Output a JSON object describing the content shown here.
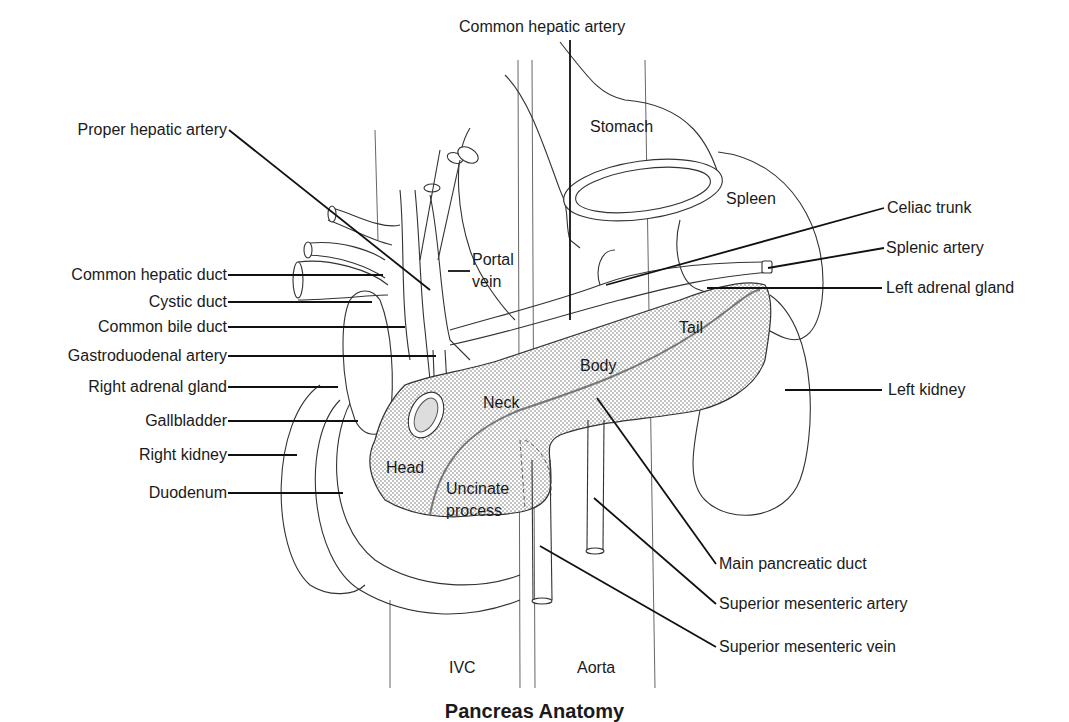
{
  "figure": {
    "title": "Pancreas anatomy",
    "caption_partial": "Pancreas Anatomy"
  },
  "labels_left": [
    {
      "id": "proper-hepatic-artery",
      "text": "Proper hepatic artery"
    },
    {
      "id": "common-hepatic-duct",
      "text": "Common hepatic duct"
    },
    {
      "id": "cystic-duct",
      "text": "Cystic duct"
    },
    {
      "id": "common-bile-duct",
      "text": "Common bile duct"
    },
    {
      "id": "gastroduodenal-artery",
      "text": "Gastroduodenal artery"
    },
    {
      "id": "right-adrenal-gland",
      "text": "Right adrenal gland"
    },
    {
      "id": "gallbladder",
      "text": "Gallbladder"
    },
    {
      "id": "right-kidney",
      "text": "Right kidney"
    },
    {
      "id": "duodenum",
      "text": "Duodenum"
    }
  ],
  "labels_right": [
    {
      "id": "celiac-trunk",
      "text": "Celiac trunk"
    },
    {
      "id": "splenic-artery",
      "text": "Splenic artery"
    },
    {
      "id": "left-adrenal-gland",
      "text": "Left adrenal gland"
    },
    {
      "id": "left-kidney",
      "text": "Left kidney"
    },
    {
      "id": "main-pancreatic-duct",
      "text": "Main pancreatic duct"
    },
    {
      "id": "superior-mesenteric-artery",
      "text": "Superior mesenteric artery"
    },
    {
      "id": "superior-mesenteric-vein",
      "text": "Superior mesenteric vein"
    }
  ],
  "labels_top": {
    "common-hepatic-artery": "Common hepatic artery"
  },
  "labels_inner": {
    "stomach": "Stomach",
    "spleen": "Spleen",
    "portal_vein_1": "Portal",
    "portal_vein_2": "vein",
    "neck": "Neck",
    "body": "Body",
    "tail": "Tail",
    "head": "Head",
    "uncinate_1": "Uncinate",
    "uncinate_2": "process",
    "ivc": "IVC",
    "aorta": "Aorta"
  }
}
